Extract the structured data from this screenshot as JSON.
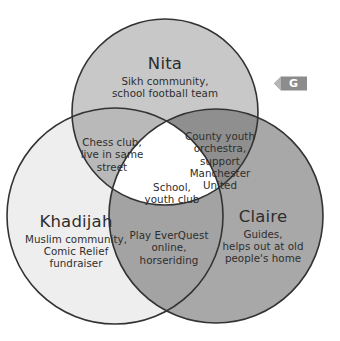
{
  "diagram": {
    "type": "venn-3-set",
    "background_color": "#ffffff",
    "outline_color": "#333333",
    "sets": [
      {
        "id": "nita",
        "name": "Nita",
        "description": "Sikh community,\nschool football team",
        "desc_line1": "Sikh community,",
        "desc_line2": "school football team",
        "fill_color": "#c8c8c8",
        "position": "top"
      },
      {
        "id": "khadijah",
        "name": "Khadijah",
        "description": "Muslim community,\nComic Relief\nfundraiser",
        "desc_line1": "Muslim community,",
        "desc_line2": "Comic Relief",
        "desc_line3": "fundraiser",
        "fill_color": "#eeeeee",
        "position": "bottom-left"
      },
      {
        "id": "claire",
        "name": "Claire",
        "description": "Guides,\nhelps out at old\npeople's home",
        "desc_line1": "Guides,",
        "desc_line2": "helps out at old",
        "desc_line3": "people's home",
        "fill_color": "#a8a8a8",
        "position": "bottom-right"
      }
    ],
    "intersections": [
      {
        "id": "nita-khadijah",
        "sets": [
          "Nita",
          "Khadijah"
        ],
        "text": "Chess club,\nlive in same\nstreet",
        "line1": "Chess club,",
        "line2": "live in same",
        "line3": "street",
        "fill_color": "#b9b9b9"
      },
      {
        "id": "nita-claire",
        "sets": [
          "Nita",
          "Claire"
        ],
        "text": "County youth\norchestra,\nsupport\nManchester\nUnited",
        "line1": "County youth",
        "line2": "orchestra,",
        "line3": "support",
        "line4": "Manchester",
        "line5": "United",
        "fill_color": "#8f8f8f"
      },
      {
        "id": "khadijah-claire",
        "sets": [
          "Khadijah",
          "Claire"
        ],
        "text": "Play EverQuest\nonline,\nhorseriding",
        "line1": "Play EverQuest",
        "line2": "online,",
        "line3": "horseriding",
        "fill_color": "#a3a3a3"
      },
      {
        "id": "all-three",
        "sets": [
          "Nita",
          "Khadijah",
          "Claire"
        ],
        "text": "School,\nyouth club",
        "line1": "School,",
        "line2": "youth club",
        "fill_color": "#ffffff"
      }
    ]
  },
  "badge": {
    "letter": "G",
    "fill_color": "#8c8c8c",
    "text_color": "#ffffff",
    "shape": "left-pointing-pennant"
  }
}
